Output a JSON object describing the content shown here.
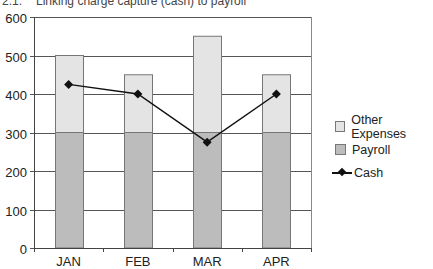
{
  "figure": {
    "number": "2.1.",
    "title": "Linking charge capture (cash) to payroll"
  },
  "legend": {
    "items": [
      {
        "label": "Other Expenses",
        "color": "#e4e4e4",
        "type": "bar"
      },
      {
        "label": "Payroll",
        "color": "#bcbcbc",
        "type": "bar"
      },
      {
        "label": "Cash",
        "color": "#111111",
        "type": "line-marker"
      }
    ]
  },
  "chart_data": {
    "type": "bar",
    "stacked": true,
    "title": "Linking charge capture (cash) to payroll",
    "xlabel": "",
    "ylabel": "",
    "categories": [
      "JAN",
      "FEB",
      "MAR",
      "APR"
    ],
    "series": [
      {
        "name": "Payroll",
        "type": "bar",
        "color": "#bcbcbc",
        "values": [
          300,
          300,
          300,
          300
        ]
      },
      {
        "name": "Other Expenses",
        "type": "bar",
        "color": "#e4e4e4",
        "values": [
          200,
          150,
          250,
          150
        ]
      },
      {
        "name": "Cash",
        "type": "line",
        "marker": "diamond",
        "color": "#111111",
        "values": [
          425,
          400,
          275,
          400
        ]
      }
    ],
    "totals": [
      500,
      450,
      550,
      450
    ],
    "ylim": [
      0,
      600
    ],
    "yticks": [
      0,
      100,
      200,
      300,
      400,
      500,
      600
    ],
    "grid": true,
    "legend_position": "right"
  }
}
